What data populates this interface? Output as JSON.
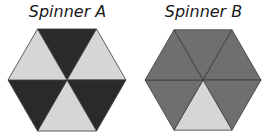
{
  "spinners": [
    {
      "title": "Spinner A",
      "sections": [
        {
          "position": "top",
          "shade": "dark"
        },
        {
          "position": "upper-right",
          "shade": "light"
        },
        {
          "position": "lower-right",
          "shade": "dark"
        },
        {
          "position": "bottom",
          "shade": "light"
        },
        {
          "position": "lower-left",
          "shade": "dark"
        },
        {
          "position": "upper-left",
          "shade": "light"
        }
      ]
    },
    {
      "title": "Spinner B",
      "sections": [
        {
          "position": "top",
          "shade": "medium"
        },
        {
          "position": "upper-right",
          "shade": "medium"
        },
        {
          "position": "lower-right",
          "shade": "medium"
        },
        {
          "position": "bottom",
          "shade": "light"
        },
        {
          "position": "lower-left",
          "shade": "medium"
        },
        {
          "position": "upper-left",
          "shade": "medium"
        }
      ]
    }
  ],
  "colors": {
    "dark": "#2a2a2a",
    "light": "#d6d6d6",
    "medium": "#6f6f6f",
    "edge": "#3a3a3a"
  }
}
